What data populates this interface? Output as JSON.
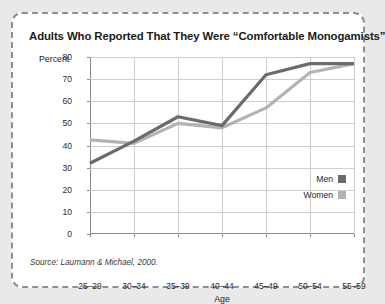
{
  "figure": {
    "title": "Adults Who Reported That They Were “Comfortable Monogamists”",
    "source": "Source: Laumann & Michael, 2000.",
    "border_style": "dashed",
    "border_color": "#8b8f9a",
    "background": "#ffffff",
    "page_background": "#e9e9e9"
  },
  "chart_data": {
    "type": "line",
    "title": "Adults Who Reported That They Were “Comfortable Monogamists”",
    "xlabel": "Age",
    "ylabel": "Percent",
    "categories": [
      "25–29",
      "30–34",
      "35–39",
      "40–44",
      "45–49",
      "50–54",
      "55–59"
    ],
    "series": [
      {
        "name": "Men",
        "color": "#6b6b6b",
        "values": [
          32,
          42,
          53,
          49,
          72,
          77,
          77
        ]
      },
      {
        "name": "Women",
        "color": "#b3b3b3",
        "values": [
          42.5,
          41,
          50,
          48,
          57,
          73,
          77
        ]
      }
    ],
    "ylim": [
      0,
      80
    ],
    "yticks": [
      0,
      10,
      20,
      30,
      40,
      50,
      60,
      70,
      80
    ],
    "ytick_labels": [
      "0",
      "10",
      "20",
      "30",
      "40",
      "50",
      "60",
      "70",
      "80"
    ],
    "grid": true,
    "legend_position": "inside-right"
  },
  "legend": {
    "items": [
      {
        "label": "Men",
        "color": "#6b6b6b"
      },
      {
        "label": "Women",
        "color": "#b3b3b3"
      }
    ]
  }
}
